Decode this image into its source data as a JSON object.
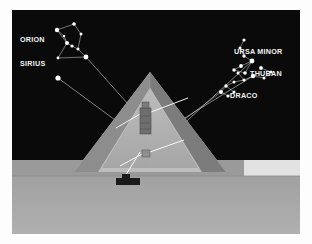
{
  "figure": {
    "frame_color": "#ffffff",
    "sky_color": "#0a0a0a",
    "ground_color": "#a8a8a8",
    "ground_far_color": "#9a9a9a",
    "ground_strip_color": "#e8e8e8",
    "star_color": "#ffffff",
    "label_color": "#f2f2f2",
    "shaft_color": "#ffffff",
    "sightline_color": "#b9b9b9"
  },
  "labels": {
    "orion": "ORION",
    "sirius": "SIRIUS",
    "ursa_minor": "URSA MINOR",
    "thuban": "THUBAN",
    "draco": "DRACO"
  },
  "label_positions": {
    "orion": {
      "x": 8,
      "y": 32,
      "anchor": "start"
    },
    "sirius": {
      "x": 8,
      "y": 56,
      "anchor": "start"
    },
    "ursa_minor": {
      "x": 222,
      "y": 44,
      "anchor": "start"
    },
    "thuban": {
      "x": 238,
      "y": 66,
      "anchor": "start"
    },
    "draco": {
      "x": 218,
      "y": 88,
      "anchor": "start"
    }
  },
  "pyramid": {
    "apex": {
      "x": 138,
      "y": 62
    },
    "base_left": {
      "x": 62,
      "y": 162
    },
    "base_right": {
      "x": 214,
      "y": 162
    },
    "front_face_color": "#c9c9c9",
    "left_face_color": "#8f8f8f",
    "right_face_color": "#7e7e7e",
    "interior_color": "#b3b3b3",
    "entrance_color": "#1a1a1a"
  },
  "chambers": {
    "kings_chamber": {
      "x": 128,
      "y": 98,
      "w": 11,
      "h": 26,
      "label": "kings-chamber"
    },
    "queens_chamber": {
      "x": 130,
      "y": 140,
      "w": 8,
      "h": 7,
      "label": "queens-chamber"
    },
    "entrance_block": {
      "x": 104,
      "y": 168,
      "w": 24,
      "h": 7
    }
  },
  "constellations": {
    "orion": {
      "stars": [
        {
          "x": 45,
          "y": 20,
          "r": 2.2
        },
        {
          "x": 62,
          "y": 14,
          "r": 1.8
        },
        {
          "x": 69,
          "y": 24,
          "r": 1.5
        },
        {
          "x": 55,
          "y": 33,
          "r": 2.0
        },
        {
          "x": 60,
          "y": 36,
          "r": 1.6
        },
        {
          "x": 66,
          "y": 39,
          "r": 1.5
        },
        {
          "x": 74,
          "y": 47,
          "r": 2.4
        },
        {
          "x": 46,
          "y": 48,
          "r": 1.4
        },
        {
          "x": 52,
          "y": 26,
          "r": 1.2
        }
      ],
      "lines": [
        [
          0,
          1
        ],
        [
          1,
          2
        ],
        [
          2,
          5
        ],
        [
          0,
          3
        ],
        [
          3,
          4
        ],
        [
          4,
          5
        ],
        [
          3,
          7
        ],
        [
          7,
          6
        ],
        [
          5,
          6
        ],
        [
          0,
          8
        ],
        [
          8,
          3
        ]
      ]
    },
    "sirius": {
      "stars": [
        {
          "x": 46,
          "y": 68,
          "r": 2.6
        }
      ],
      "lines": []
    },
    "ursa_minor": {
      "stars": [
        {
          "x": 232,
          "y": 30,
          "r": 1.6
        },
        {
          "x": 228,
          "y": 38,
          "r": 1.5
        },
        {
          "x": 232,
          "y": 46,
          "r": 1.7
        },
        {
          "x": 240,
          "y": 51,
          "r": 2.4
        },
        {
          "x": 229,
          "y": 56,
          "r": 1.9
        },
        {
          "x": 222,
          "y": 60,
          "r": 1.7
        },
        {
          "x": 233,
          "y": 63,
          "r": 1.8
        }
      ],
      "lines": [
        [
          0,
          1
        ],
        [
          1,
          2
        ],
        [
          2,
          3
        ],
        [
          3,
          4
        ],
        [
          4,
          5
        ],
        [
          5,
          6
        ],
        [
          6,
          3
        ]
      ]
    },
    "draco": {
      "stars": [
        {
          "x": 249,
          "y": 58,
          "r": 1.9
        },
        {
          "x": 259,
          "y": 62,
          "r": 1.6
        },
        {
          "x": 252,
          "y": 68,
          "r": 1.5
        },
        {
          "x": 241,
          "y": 66,
          "r": 1.5
        },
        {
          "x": 232,
          "y": 70,
          "r": 1.6
        },
        {
          "x": 222,
          "y": 72,
          "r": 1.5
        },
        {
          "x": 214,
          "y": 76,
          "r": 1.7
        },
        {
          "x": 209,
          "y": 82,
          "r": 2.0
        },
        {
          "x": 216,
          "y": 86,
          "r": 1.6
        },
        {
          "x": 222,
          "y": 82,
          "r": 1.5
        },
        {
          "x": 226,
          "y": 63,
          "r": 1.5
        }
      ],
      "lines": [
        [
          0,
          1
        ],
        [
          1,
          2
        ],
        [
          2,
          3
        ],
        [
          3,
          4
        ],
        [
          4,
          5
        ],
        [
          5,
          6
        ],
        [
          6,
          7
        ],
        [
          7,
          8
        ],
        [
          8,
          9
        ],
        [
          9,
          6
        ],
        [
          10,
          4
        ]
      ]
    },
    "thuban": {
      "stars": [
        {
          "x": 241,
          "y": 66,
          "r": 2.2
        }
      ],
      "lines": []
    }
  },
  "sight_lines": [
    {
      "name": "orion-to-pyramid",
      "x1": 74,
      "y1": 47,
      "x2": 150,
      "y2": 132
    },
    {
      "name": "sirius-to-pyramid",
      "x1": 46,
      "y1": 68,
      "x2": 152,
      "y2": 146
    },
    {
      "name": "ursa-minor-to-pyramid",
      "x1": 240,
      "y1": 51,
      "x2": 152,
      "y2": 132
    },
    {
      "name": "thuban-to-pyramid",
      "x1": 241,
      "y1": 66,
      "x2": 150,
      "y2": 122
    },
    {
      "name": "draco-to-pyramid",
      "x1": 209,
      "y1": 82,
      "x2": 150,
      "y2": 126
    }
  ],
  "interior_shafts": [
    {
      "name": "kings-north-shaft",
      "x1": 139,
      "y1": 102,
      "x2": 176,
      "y2": 88
    },
    {
      "name": "kings-south-shaft",
      "x1": 128,
      "y1": 104,
      "x2": 104,
      "y2": 118
    },
    {
      "name": "queens-north-shaft",
      "x1": 138,
      "y1": 142,
      "x2": 172,
      "y2": 130
    },
    {
      "name": "queens-south-shaft",
      "x1": 130,
      "y1": 144,
      "x2": 108,
      "y2": 156
    },
    {
      "name": "descending-passage",
      "x1": 128,
      "y1": 142,
      "x2": 112,
      "y2": 168
    }
  ]
}
